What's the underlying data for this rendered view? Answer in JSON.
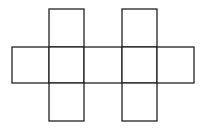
{
  "diagram": {
    "type": "cube-net-style grid of squares",
    "stroke_color": "#222222",
    "fill_color": "#ffffff",
    "stroke_width": 1.3,
    "squares": [
      {
        "name": "top-left-square",
        "x": 49,
        "y": 9,
        "w": 35,
        "h": 38
      },
      {
        "name": "top-right-square",
        "x": 122,
        "y": 9,
        "w": 35,
        "h": 38
      },
      {
        "name": "row-square-1",
        "x": 12,
        "y": 47,
        "w": 37,
        "h": 36
      },
      {
        "name": "row-square-2",
        "x": 49,
        "y": 47,
        "w": 35,
        "h": 36
      },
      {
        "name": "row-square-3",
        "x": 84,
        "y": 47,
        "w": 38,
        "h": 36
      },
      {
        "name": "row-square-4",
        "x": 122,
        "y": 47,
        "w": 35,
        "h": 36
      },
      {
        "name": "row-square-5",
        "x": 157,
        "y": 47,
        "w": 37,
        "h": 36
      },
      {
        "name": "bottom-left-square",
        "x": 49,
        "y": 83,
        "w": 35,
        "h": 38
      },
      {
        "name": "bottom-right-square",
        "x": 122,
        "y": 83,
        "w": 35,
        "h": 38
      }
    ]
  }
}
